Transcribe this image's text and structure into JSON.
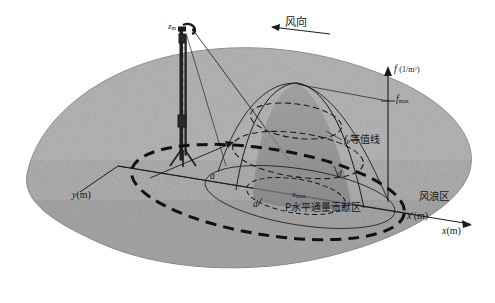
{
  "figure": {
    "type": "scientific-diagram",
    "background_color": "#ffffff",
    "terrain_color": "#9e9e9e",
    "surface_fill": "#8a8a8a",
    "line_color": "#1a1a1a"
  },
  "labels": {
    "tower_height": {
      "base": "z",
      "sub": "m"
    },
    "wind_direction": "风向",
    "f_axis": {
      "symbol": "f",
      "unit": "(1/m",
      "unit_sup": "2",
      "unit_end": ")"
    },
    "f_max": {
      "base": "f",
      "sub": "max"
    },
    "contour": {
      "base": "f",
      "sub": "P",
      "text": "等值线"
    },
    "x_max": {
      "base": "x",
      "sub": "max"
    },
    "footprint_area": "P水平通量贡献区",
    "fetch_area": "风浪区",
    "a": "a",
    "d_right": "d",
    "d_left": "d",
    "y_axis": {
      "symbol": "y",
      "unit": "(m)"
    },
    "x_prime_axis": {
      "symbol": "x",
      "prime": "′",
      "unit": "(m)"
    },
    "x_axis": {
      "symbol": "x",
      "unit": "(m)"
    }
  },
  "geometry": {
    "origin": {
      "x": 118,
      "y": 166
    },
    "x_axis_end": {
      "x": 472,
      "y": 226
    },
    "f_axis_top": {
      "x": 388,
      "y": 68
    },
    "f_max_tick_y": 101,
    "peak": {
      "x": 296,
      "y": 83
    }
  }
}
